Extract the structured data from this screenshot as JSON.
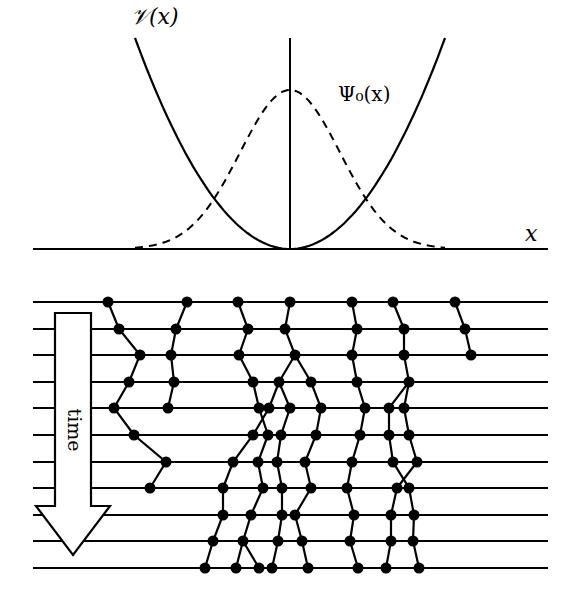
{
  "colors": {
    "ink": "#000000",
    "background": "#ffffff"
  },
  "top_panel": {
    "potential_label": "𝒱(x)",
    "wavefunction_label": "Ψ₀(x)",
    "axis_label": "x",
    "axis": {
      "x1": 33,
      "x2": 548,
      "y": 249
    },
    "center_x": 290,
    "vertical_line": {
      "y1": 38,
      "y2": 249
    },
    "potential": {
      "left_top": [
        135,
        38
      ],
      "right_top": [
        445,
        38
      ],
      "bottom": [
        290,
        249
      ]
    },
    "wavefunction": {
      "peak_y": 90,
      "baseline_y": 249,
      "x_start": 135,
      "x_end": 445,
      "sigma": 50
    }
  },
  "bottom_panel": {
    "time_label": "time",
    "time_lines": {
      "x1": 33,
      "x2": 548,
      "ys": [
        302,
        329,
        355,
        382,
        408,
        435,
        462,
        488,
        515,
        541,
        568
      ]
    },
    "arrow": {
      "shaft_left": 55,
      "shaft_right": 91,
      "top": 313,
      "head_base_y": 506,
      "head_left": 36,
      "head_right": 110,
      "tip": [
        73,
        555
      ]
    },
    "node_radius": 5.5,
    "paths": [
      [
        [
          108,
          302
        ],
        [
          119,
          329
        ],
        [
          140,
          355
        ],
        [
          129,
          382
        ],
        [
          114,
          408
        ],
        [
          134,
          435
        ],
        [
          166,
          462
        ],
        [
          150,
          488
        ]
      ],
      [
        [
          187,
          302
        ],
        [
          176,
          329
        ],
        [
          171,
          355
        ],
        [
          174,
          382
        ],
        [
          168,
          408
        ]
      ],
      [
        [
          238,
          302
        ],
        [
          248,
          329
        ],
        [
          239,
          355
        ],
        [
          253,
          382
        ],
        [
          259,
          408
        ],
        [
          268,
          435
        ],
        [
          258,
          462
        ],
        [
          263,
          488
        ],
        [
          251,
          515
        ],
        [
          243,
          541
        ],
        [
          236,
          568
        ]
      ],
      [
        [
          243,
          541
        ],
        [
          259,
          568
        ]
      ],
      [
        [
          290,
          302
        ],
        [
          285,
          329
        ],
        [
          295,
          355
        ],
        [
          279,
          382
        ],
        [
          269,
          408
        ],
        [
          253,
          435
        ],
        [
          233,
          462
        ],
        [
          223,
          488
        ],
        [
          223,
          515
        ],
        [
          213,
          541
        ],
        [
          205,
          568
        ]
      ],
      [
        [
          279,
          382
        ],
        [
          290,
          408
        ],
        [
          281,
          435
        ],
        [
          277,
          462
        ],
        [
          282,
          488
        ],
        [
          282,
          515
        ],
        [
          278,
          541
        ],
        [
          272,
          568
        ]
      ],
      [
        [
          295,
          355
        ],
        [
          311,
          382
        ],
        [
          321,
          408
        ],
        [
          316,
          435
        ],
        [
          305,
          462
        ],
        [
          311,
          488
        ],
        [
          295,
          515
        ],
        [
          302,
          541
        ],
        [
          308,
          568
        ]
      ],
      [
        [
          352,
          302
        ],
        [
          357,
          329
        ],
        [
          352,
          355
        ],
        [
          357,
          382
        ],
        [
          365,
          408
        ],
        [
          360,
          435
        ],
        [
          352,
          462
        ],
        [
          347,
          488
        ],
        [
          354,
          515
        ],
        [
          350,
          541
        ],
        [
          358,
          568
        ]
      ],
      [
        [
          393,
          302
        ],
        [
          404,
          329
        ],
        [
          404,
          355
        ],
        [
          409,
          382
        ],
        [
          389,
          408
        ],
        [
          389,
          435
        ],
        [
          393,
          462
        ],
        [
          409,
          488
        ],
        [
          414,
          515
        ],
        [
          413,
          541
        ],
        [
          419,
          568
        ]
      ],
      [
        [
          409,
          382
        ],
        [
          404,
          408
        ],
        [
          409,
          435
        ],
        [
          417,
          462
        ],
        [
          397,
          488
        ],
        [
          391,
          515
        ],
        [
          391,
          541
        ],
        [
          386,
          568
        ]
      ],
      [
        [
          455,
          302
        ],
        [
          465,
          329
        ],
        [
          471,
          355
        ]
      ]
    ]
  }
}
